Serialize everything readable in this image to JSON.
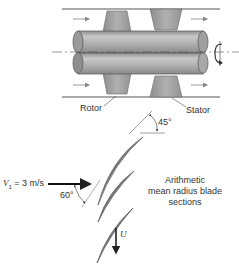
{
  "figure": {
    "labels": {
      "rotor": "Rotor",
      "stator": "Stator",
      "angle_outlet": "45°",
      "angle_inlet": "60°",
      "inlet_velocity_symbol": "V",
      "inlet_velocity_subscript": "1",
      "inlet_velocity_value": " = 3 m/s",
      "blade_speed": "U",
      "blade_sections_line1": "Arithmetic",
      "blade_sections_line2": "mean radius blade",
      "blade_sections_line3": "sections"
    },
    "icons": {
      "rotation": "rotation-arrow-icon",
      "flow": "flow-arrow-icon"
    },
    "colors": {
      "shaft": "#a9a9a9",
      "blade_fill": "#9e9e9e",
      "line": "#444444",
      "text": "#333333"
    }
  }
}
